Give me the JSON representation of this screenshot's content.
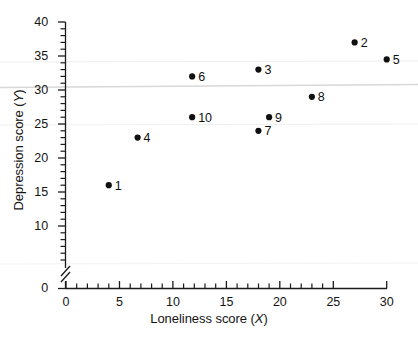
{
  "chart_data": {
    "type": "scatter",
    "title": "",
    "xlabel": "Loneliness score (X)",
    "ylabel": "Depression score (Y)",
    "xlim": [
      0,
      31
    ],
    "ylim": [
      0,
      40
    ],
    "y_axis_break": true,
    "y_break_between": [
      0,
      10
    ],
    "grid": false,
    "legend": null,
    "x_major_ticks": [
      0,
      5,
      10,
      15,
      20,
      25,
      30
    ],
    "x_minor_tick_step": 1,
    "y_major_ticks": [
      0,
      10,
      15,
      20,
      25,
      30,
      35,
      40
    ],
    "y_minor_tick_step": 1,
    "x_tick_labels": [
      "0",
      "5",
      "10",
      "15",
      "20",
      "25",
      "30"
    ],
    "y_tick_labels": [
      "0",
      "10",
      "15",
      "20",
      "25",
      "30",
      "35",
      "40"
    ],
    "point_labels": [
      "1",
      "2",
      "3",
      "4",
      "5",
      "6",
      "7",
      "8",
      "9",
      "10"
    ],
    "x": [
      4,
      27,
      18,
      6.7,
      30,
      11.8,
      18,
      23,
      19,
      11.8
    ],
    "y": [
      16,
      37,
      33,
      23,
      34.5,
      32,
      24,
      29,
      26,
      26
    ],
    "points": [
      {
        "label": "1",
        "x": 4,
        "y": 16
      },
      {
        "label": "2",
        "x": 27,
        "y": 37
      },
      {
        "label": "3",
        "x": 18,
        "y": 33
      },
      {
        "label": "4",
        "x": 6.7,
        "y": 23
      },
      {
        "label": "5",
        "x": 30,
        "y": 34.5
      },
      {
        "label": "6",
        "x": 11.8,
        "y": 32
      },
      {
        "label": "7",
        "x": 18,
        "y": 24
      },
      {
        "label": "8",
        "x": 23,
        "y": 29
      },
      {
        "label": "9",
        "x": 19,
        "y": 26
      },
      {
        "label": "10",
        "x": 11.8,
        "y": 26
      }
    ],
    "marker_color": "#101010",
    "axis_color": "#1a1a1a",
    "background_color": "#ffffff"
  },
  "axes": {
    "x_title_main": "Loneliness score (",
    "x_title_var": "X",
    "x_title_end": ")",
    "y_title_main": "Depression score (",
    "y_title_var": "Y",
    "y_title_end": ")"
  },
  "ticks": {
    "y": [
      {
        "label": "40",
        "value": 40
      },
      {
        "label": "35",
        "value": 35
      },
      {
        "label": "30",
        "value": 30
      },
      {
        "label": "25",
        "value": 25
      },
      {
        "label": "20",
        "value": 20
      },
      {
        "label": "15",
        "value": 15
      },
      {
        "label": "10",
        "value": 10
      },
      {
        "label": "0",
        "value": 0
      }
    ],
    "x": [
      {
        "label": "0",
        "value": 0
      },
      {
        "label": "5",
        "value": 5
      },
      {
        "label": "10",
        "value": 10
      },
      {
        "label": "15",
        "value": 15
      },
      {
        "label": "20",
        "value": 20
      },
      {
        "label": "25",
        "value": 25
      },
      {
        "label": "30",
        "value": 30
      }
    ]
  }
}
